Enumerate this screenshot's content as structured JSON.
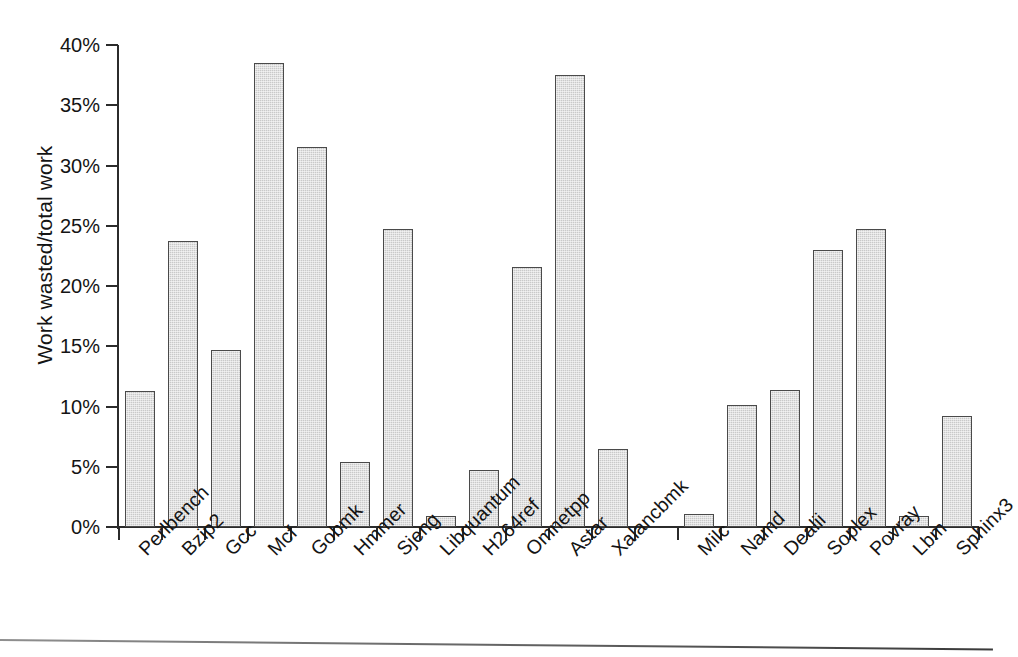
{
  "chart_data": {
    "type": "bar",
    "title": "",
    "xlabel": "",
    "ylabel": "Work wasted/total work",
    "ylim": [
      0,
      40
    ],
    "ytick_labels": [
      "0%",
      "5%",
      "10%",
      "15%",
      "20%",
      "25%",
      "30%",
      "35%",
      "40%"
    ],
    "ytick_values": [
      0,
      5,
      10,
      15,
      20,
      25,
      30,
      35,
      40
    ],
    "grid": false,
    "legend": false,
    "unit": "%",
    "bar_color": "#c9c9c9",
    "bar_edge_color": "#4a4a4a",
    "axis_color": "#2b2b2b",
    "categories": [
      "Perlbench",
      "Bzip2",
      "Gcc",
      "Mcf",
      "Gobmk",
      "Hmmer",
      "Sjeng",
      "Libquantum",
      "H264ref",
      "Omnetpp",
      "Astar",
      "Xalancbmk",
      "",
      "Milc",
      "Namd",
      "Dealii",
      "Soplex",
      "Povray",
      "Lbm",
      "Sphinx3"
    ],
    "values": [
      11.3,
      23.7,
      14.7,
      38.5,
      31.5,
      5.4,
      24.7,
      0.9,
      4.7,
      21.6,
      37.5,
      6.5,
      null,
      1.1,
      10.1,
      11.4,
      23.0,
      24.7,
      0.9,
      9.2
    ]
  }
}
